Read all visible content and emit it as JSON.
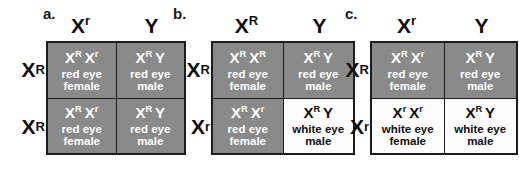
{
  "figure": {
    "shaded_color": "#8a8a8a",
    "plain_color": "#fdfdfd",
    "border_color": "#1c1c1c"
  },
  "panels": [
    {
      "letter": "a.",
      "col_headers": [
        {
          "base": "X",
          "sup": "r"
        },
        {
          "base": "Y",
          "sup": ""
        }
      ],
      "row_headers": [
        {
          "base": "X",
          "sup": "R"
        },
        {
          "base": "X",
          "sup": "R"
        }
      ],
      "cells": [
        {
          "alleles": [
            {
              "base": "X",
              "sup": "R"
            },
            {
              "base": "X",
              "sup": "r"
            }
          ],
          "pheno_line1": "red eye",
          "pheno_line2": "female",
          "shaded": true
        },
        {
          "alleles": [
            {
              "base": "X",
              "sup": "R"
            },
            {
              "base": "Y",
              "sup": ""
            }
          ],
          "pheno_line1": "red eye",
          "pheno_line2": "male",
          "shaded": true
        },
        {
          "alleles": [
            {
              "base": "X",
              "sup": "R"
            },
            {
              "base": "X",
              "sup": "r"
            }
          ],
          "pheno_line1": "red eye",
          "pheno_line2": "female",
          "shaded": true
        },
        {
          "alleles": [
            {
              "base": "X",
              "sup": "R"
            },
            {
              "base": "Y",
              "sup": ""
            }
          ],
          "pheno_line1": "red eye",
          "pheno_line2": "male",
          "shaded": true
        }
      ]
    },
    {
      "letter": "b.",
      "col_headers": [
        {
          "base": "X",
          "sup": "R"
        },
        {
          "base": "Y",
          "sup": ""
        }
      ],
      "row_headers": [
        {
          "base": "X",
          "sup": "R"
        },
        {
          "base": "X",
          "sup": "r"
        }
      ],
      "cells": [
        {
          "alleles": [
            {
              "base": "X",
              "sup": "R"
            },
            {
              "base": "X",
              "sup": "R"
            }
          ],
          "pheno_line1": "red eye",
          "pheno_line2": "female",
          "shaded": true
        },
        {
          "alleles": [
            {
              "base": "X",
              "sup": "R"
            },
            {
              "base": "Y",
              "sup": ""
            }
          ],
          "pheno_line1": "red eye",
          "pheno_line2": "male",
          "shaded": true
        },
        {
          "alleles": [
            {
              "base": "X",
              "sup": "R"
            },
            {
              "base": "X",
              "sup": "r"
            }
          ],
          "pheno_line1": "red eye",
          "pheno_line2": "female",
          "shaded": true
        },
        {
          "alleles": [
            {
              "base": "X",
              "sup": "R"
            },
            {
              "base": "Y",
              "sup": ""
            }
          ],
          "pheno_line1": "white eye",
          "pheno_line2": "male",
          "shaded": false
        }
      ]
    },
    {
      "letter": "c.",
      "col_headers": [
        {
          "base": "X",
          "sup": "r"
        },
        {
          "base": "Y",
          "sup": ""
        }
      ],
      "row_headers": [
        {
          "base": "X",
          "sup": "R"
        },
        {
          "base": "X",
          "sup": "r"
        }
      ],
      "cells": [
        {
          "alleles": [
            {
              "base": "X",
              "sup": "R"
            },
            {
              "base": "X",
              "sup": "r"
            }
          ],
          "pheno_line1": "red eye",
          "pheno_line2": "female",
          "shaded": true
        },
        {
          "alleles": [
            {
              "base": "X",
              "sup": "R"
            },
            {
              "base": "Y",
              "sup": ""
            }
          ],
          "pheno_line1": "red eye",
          "pheno_line2": "male",
          "shaded": true
        },
        {
          "alleles": [
            {
              "base": "X",
              "sup": "r"
            },
            {
              "base": "X",
              "sup": "r"
            }
          ],
          "pheno_line1": "white eye",
          "pheno_line2": "female",
          "shaded": false
        },
        {
          "alleles": [
            {
              "base": "X",
              "sup": "R"
            },
            {
              "base": "Y",
              "sup": ""
            }
          ],
          "pheno_line1": "white eye",
          "pheno_line2": "male",
          "shaded": false
        }
      ]
    }
  ]
}
